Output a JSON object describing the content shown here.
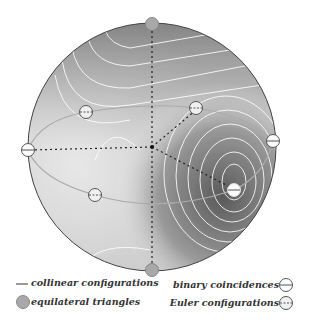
{
  "figure": {
    "sphere": {
      "cx": 152,
      "cy": 147,
      "r": 124
    },
    "colors": {
      "outline": "#444444",
      "dark": "#5a5a5a",
      "light": "#f4f4f4",
      "contour": "#ffffff",
      "collinear": "#aaaaaa",
      "dotted": "#222222",
      "equilateral": "#a8a8a8"
    },
    "points": {
      "equilateral": [
        {
          "x": 152,
          "y": 24
        },
        {
          "x": 152,
          "y": 270
        }
      ],
      "binary": [
        {
          "x": 28,
          "y": 150
        },
        {
          "x": 273,
          "y": 141
        },
        {
          "x": 234,
          "y": 190
        }
      ],
      "euler": [
        {
          "x": 86,
          "y": 112
        },
        {
          "x": 196,
          "y": 108
        },
        {
          "x": 95,
          "y": 195
        }
      ],
      "center": {
        "x": 152,
        "y": 147
      }
    }
  },
  "legend": {
    "collinear": "collinear configurations",
    "equilateral": "equilateral triangles",
    "binary": "binary coincidences",
    "euler": "Euler configurations"
  }
}
